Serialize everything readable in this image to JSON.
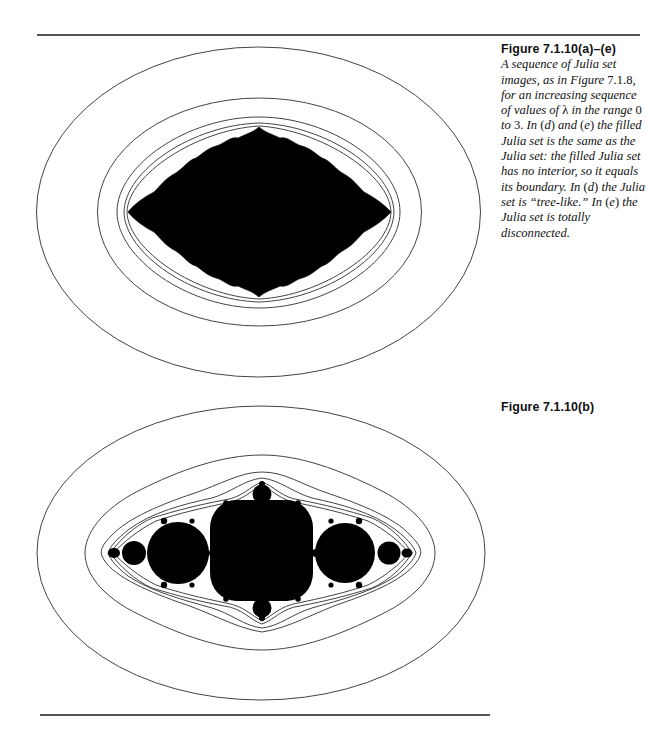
{
  "page": {
    "figure_a": {
      "label": "Figure 7.1.10(a)–(e)",
      "caption_segments": [
        {
          "text": "A sequence of Julia set images, as in Figure ",
          "style": "italic"
        },
        {
          "text": "7.1.8,",
          "style": "upright"
        },
        {
          "text": " for an increasing sequence of values of ",
          "style": "italic"
        },
        {
          "text": "λ",
          "style": "upright"
        },
        {
          "text": " in the range ",
          "style": "italic"
        },
        {
          "text": "0",
          "style": "upright"
        },
        {
          "text": " to ",
          "style": "italic"
        },
        {
          "text": "3.",
          "style": "upright"
        },
        {
          "text": " In ",
          "style": "italic"
        },
        {
          "text": "(",
          "style": "upright"
        },
        {
          "text": "d",
          "style": "italic"
        },
        {
          "text": ")",
          "style": "upright"
        },
        {
          "text": " and ",
          "style": "italic"
        },
        {
          "text": "(",
          "style": "upright"
        },
        {
          "text": "e",
          "style": "italic"
        },
        {
          "text": ")",
          "style": "upright"
        },
        {
          "text": " the filled Julia set is the same as the Julia set: the filled Julia set has no interior, so it equals its boundary. In ",
          "style": "italic"
        },
        {
          "text": "(",
          "style": "upright"
        },
        {
          "text": "d",
          "style": "italic"
        },
        {
          "text": ")",
          "style": "upright"
        },
        {
          "text": " the Julia set is “tree-like.” In ",
          "style": "italic"
        },
        {
          "text": "(",
          "style": "upright"
        },
        {
          "text": "e",
          "style": "italic"
        },
        {
          "text": ")",
          "style": "upright"
        },
        {
          "text": " the Julia set is totally disconnected.",
          "style": "italic"
        }
      ],
      "image_description": "Filled Julia set (black, rounded diamond) surrounded by escape-time level contours"
    },
    "figure_b": {
      "label": "Figure 7.1.10(b)",
      "image_description": "Filled Julia set (black, chain of bulbs along horizontal axis) surrounded by escape-time level contours"
    },
    "colors": {
      "ink": "#000000",
      "contour": "#444444",
      "rule": "#555555",
      "background": "#ffffff"
    }
  }
}
